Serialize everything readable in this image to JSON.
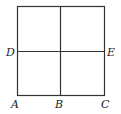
{
  "figure": {
    "type": "square-divided-into-four",
    "labels": {
      "A": "A",
      "B": "B",
      "C": "C",
      "D": "D",
      "E": "E"
    },
    "colors": {
      "line": "#333333",
      "background": "#ffffff"
    }
  }
}
